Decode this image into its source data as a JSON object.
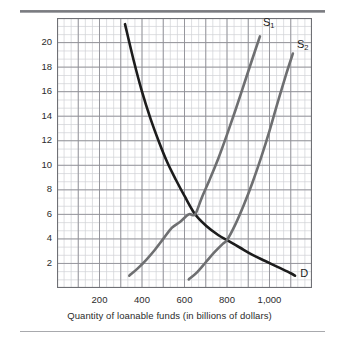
{
  "figure": {
    "kind": "economics-supply-demand-graph"
  },
  "chart_data": {
    "type": "line",
    "title": "",
    "xlabel": "Quantity of loanable funds (in billions of dollars)",
    "ylabel": "Interest rate (percent)",
    "xlim": [
      0,
      1200
    ],
    "ylim": [
      0,
      22
    ],
    "grid": true,
    "grid_major_x_step": 100,
    "grid_minor_x_step": 33.33,
    "grid_major_y_step": 2,
    "grid_minor_y_step": 0.666,
    "legend_position": "inline-curve-labels",
    "xticks": [
      200,
      400,
      600,
      800,
      1000
    ],
    "xtick_labels": [
      "200",
      "400",
      "600",
      "800",
      "1,000"
    ],
    "yticks": [
      2,
      4,
      6,
      8,
      10,
      12,
      14,
      16,
      18,
      20
    ],
    "ytick_labels": [
      "2",
      "4",
      "6",
      "8",
      "10",
      "12",
      "14",
      "16",
      "18",
      "20"
    ],
    "series": [
      {
        "name": "D",
        "label": "D",
        "role": "demand",
        "color": "#1c1c1c",
        "width": 2.6,
        "points": [
          [
            320,
            21.5
          ],
          [
            360,
            18.6
          ],
          [
            400,
            16.0
          ],
          [
            440,
            13.8
          ],
          [
            480,
            11.9
          ],
          [
            520,
            10.2
          ],
          [
            560,
            8.8
          ],
          [
            600,
            7.5
          ],
          [
            650,
            6.0
          ],
          [
            700,
            5.1
          ],
          [
            760,
            4.3
          ],
          [
            800,
            3.9
          ],
          [
            860,
            3.3
          ],
          [
            920,
            2.7
          ],
          [
            980,
            2.2
          ],
          [
            1040,
            1.7
          ],
          [
            1100,
            1.2
          ],
          [
            1120,
            1.0
          ]
        ]
      },
      {
        "name": "S1",
        "label": "S₁",
        "role": "supply-original",
        "color": "#6e6f71",
        "width": 2.6,
        "points": [
          [
            340,
            1.0
          ],
          [
            380,
            1.6
          ],
          [
            420,
            2.3
          ],
          [
            460,
            3.1
          ],
          [
            500,
            4.0
          ],
          [
            540,
            4.9
          ],
          [
            580,
            5.4
          ],
          [
            620,
            6.0
          ],
          [
            650,
            6.0
          ],
          [
            680,
            7.3
          ],
          [
            720,
            8.9
          ],
          [
            760,
            10.6
          ],
          [
            800,
            12.5
          ],
          [
            840,
            14.5
          ],
          [
            880,
            16.6
          ],
          [
            920,
            18.7
          ],
          [
            955,
            20.5
          ]
        ]
      },
      {
        "name": "S2",
        "label": "S₂",
        "role": "supply-shifted",
        "color": "#6e6f71",
        "width": 2.6,
        "points": [
          [
            620,
            0.7
          ],
          [
            660,
            1.3
          ],
          [
            700,
            2.1
          ],
          [
            740,
            2.9
          ],
          [
            780,
            3.6
          ],
          [
            800,
            3.9
          ],
          [
            840,
            5.2
          ],
          [
            880,
            6.8
          ],
          [
            920,
            8.6
          ],
          [
            960,
            10.6
          ],
          [
            1000,
            12.8
          ],
          [
            1040,
            15.2
          ],
          [
            1080,
            17.5
          ],
          [
            1110,
            19.1
          ]
        ]
      }
    ],
    "annotations": [
      {
        "text": "S₁",
        "label_plain": "S1",
        "x": 960,
        "y": 21.5
      },
      {
        "text": "S₂",
        "label_plain": "S2",
        "x": 1120,
        "y": 19.7
      },
      {
        "text": "D",
        "label_plain": "D",
        "x": 1135,
        "y": 1.1
      }
    ],
    "intersections": [
      {
        "between": [
          "D",
          "S1"
        ],
        "x": 650,
        "y": 6
      },
      {
        "between": [
          "D",
          "S2"
        ],
        "x": 800,
        "y": 4
      }
    ],
    "colors": {
      "demand": "#1c1c1c",
      "supply": "#6e6f71",
      "grid_minor": "#d0d1d6",
      "grid_major": "#8e8f95",
      "frame": "#6f7075",
      "text": "#2b2b2b"
    }
  }
}
